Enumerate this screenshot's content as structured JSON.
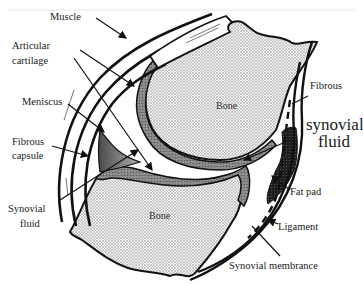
{
  "diagram": {
    "colors": {
      "background": "#ffffff",
      "outline": "#111111",
      "bone_fill": "#d9d9d9",
      "cartilage_fill": "#8a8a8a",
      "meniscus_fill": "#7a7a7a",
      "fat_pad_fill": "#2a2a2a",
      "synovial_fluid_fill": "#ffffff"
    },
    "labels": {
      "muscle": "Muscle",
      "articular_cartilage_line1": "Articular",
      "articular_cartilage_line2": "cartilage",
      "meniscus": "Meniscus",
      "fibrous_capsule_line1": "Fibrous",
      "fibrous_capsule_line2": "capsule",
      "synovial_fluid_left_line1": "Synovial",
      "synovial_fluid_left_line2": "fluid",
      "bone_upper": "Bone",
      "bone_lower": "Bone",
      "fibrous_right": "Fibrous",
      "synovial_fluid_right_line1": "synovial",
      "synovial_fluid_right_line2": "fluid",
      "fat_pad": "Fat pad",
      "ligament": "Ligament",
      "synovial_membrane": "Synovial membrance"
    }
  }
}
